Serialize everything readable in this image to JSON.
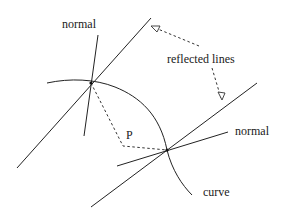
{
  "diagram": {
    "labels": {
      "normal_top": "normal",
      "reflected_lines": "reflected lines",
      "point": "P",
      "normal_right": "normal",
      "curve": "curve"
    },
    "colors": {
      "line": "#222222",
      "background": "#ffffff"
    }
  }
}
